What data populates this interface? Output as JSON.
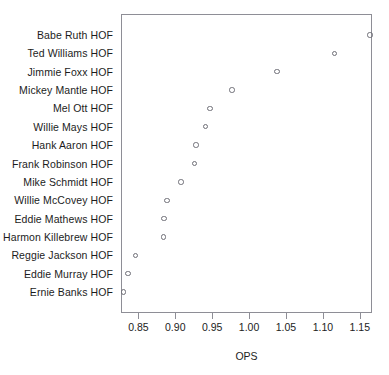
{
  "chart_data": {
    "type": "scatter",
    "title": "",
    "subtitle": "",
    "xlabel": "OPS",
    "ylabel": "",
    "xlim": [
      0.8265,
      1.1665
    ],
    "grid": false,
    "legend": null,
    "marker": "open-circle",
    "orientation": "horizontal-dotplot",
    "xticks": [
      "0.85",
      "0.90",
      "0.95",
      "1.00",
      "1.05",
      "1.10",
      "1.15"
    ],
    "xtick_values": [
      0.85,
      0.9,
      0.95,
      1.0,
      1.05,
      1.1,
      1.15
    ],
    "categories": [
      "Babe Ruth HOF",
      "Ted Williams HOF",
      "Jimmie Foxx HOF",
      "Mickey Mantle HOF",
      "Mel Ott HOF",
      "Willie Mays HOF",
      "Hank Aaron HOF",
      "Frank Robinson HOF",
      "Mike Schmidt HOF",
      "Willie McCovey HOF",
      "Eddie Mathews HOF",
      "Harmon Killebrew HOF",
      "Reggie Jackson HOF",
      "Eddie Murray HOF",
      "Ernie Banks HOF"
    ],
    "values": [
      1.164,
      1.116,
      1.038,
      0.977,
      0.947,
      0.941,
      0.928,
      0.926,
      0.908,
      0.889,
      0.885,
      0.884,
      0.846,
      0.836,
      0.83
    ],
    "points": [
      {
        "label": "Babe Ruth HOF",
        "ops": 1.164
      },
      {
        "label": "Ted Williams HOF",
        "ops": 1.116
      },
      {
        "label": "Jimmie Foxx HOF",
        "ops": 1.038
      },
      {
        "label": "Mickey Mantle HOF",
        "ops": 0.977
      },
      {
        "label": "Mel Ott HOF",
        "ops": 0.947
      },
      {
        "label": "Willie Mays HOF",
        "ops": 0.941
      },
      {
        "label": "Hank Aaron HOF",
        "ops": 0.928
      },
      {
        "label": "Frank Robinson HOF",
        "ops": 0.926
      },
      {
        "label": "Mike Schmidt HOF",
        "ops": 0.908
      },
      {
        "label": "Willie McCovey HOF",
        "ops": 0.889
      },
      {
        "label": "Eddie Mathews HOF",
        "ops": 0.885
      },
      {
        "label": "Harmon Killebrew HOF",
        "ops": 0.884
      },
      {
        "label": "Reggie Jackson HOF",
        "ops": 0.846
      },
      {
        "label": "Eddie Murray HOF",
        "ops": 0.836
      },
      {
        "label": "Ernie Banks HOF",
        "ops": 0.83
      }
    ],
    "colors": {
      "marker_stroke": "#6f6f77",
      "axis": "#8e8e96",
      "text": "#1c1c1c",
      "background": "#ffffff"
    }
  }
}
